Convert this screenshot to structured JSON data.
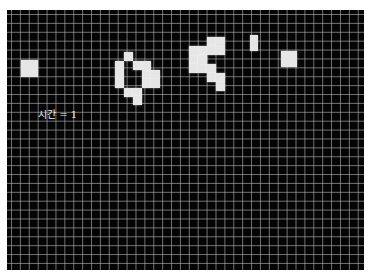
{
  "grid": {
    "cell_size_px": 8.9,
    "background": "#050505",
    "line_color": "#c8c8c8",
    "alive_color": "#e6e6e6"
  },
  "time_label": "시간 = 1",
  "cells": [
    [
      14,
      50,
      17,
      17
    ],
    [
      117,
      42,
      9,
      9
    ],
    [
      108,
      51,
      9,
      9
    ],
    [
      126,
      51,
      9,
      9
    ],
    [
      108,
      60,
      9,
      9
    ],
    [
      108,
      69,
      9,
      9
    ],
    [
      135,
      60,
      9,
      9
    ],
    [
      144,
      60,
      9,
      9
    ],
    [
      135,
      69,
      9,
      9
    ],
    [
      144,
      69,
      9,
      9
    ],
    [
      135,
      51,
      9,
      9
    ],
    [
      117,
      78,
      9,
      9
    ],
    [
      126,
      78,
      9,
      9
    ],
    [
      126,
      86,
      9,
      9
    ],
    [
      126,
      69,
      0,
      0
    ],
    [
      117,
      60,
      0,
      0
    ],
    [
      200,
      27,
      9,
      9
    ],
    [
      191,
      36,
      9,
      9
    ],
    [
      182,
      45,
      9,
      9
    ],
    [
      191,
      45,
      9,
      9
    ],
    [
      200,
      36,
      9,
      9
    ],
    [
      182,
      36,
      9,
      9
    ],
    [
      209,
      36,
      9,
      9
    ],
    [
      209,
      27,
      9,
      9
    ],
    [
      182,
      54,
      9,
      9
    ],
    [
      191,
      54,
      9,
      9
    ],
    [
      200,
      54,
      9,
      9
    ],
    [
      200,
      63,
      9,
      9
    ],
    [
      209,
      63,
      9,
      9
    ],
    [
      209,
      72,
      9,
      9
    ],
    [
      191,
      45,
      9,
      9
    ],
    [
      243,
      25,
      8,
      16
    ],
    [
      274,
      41,
      16,
      16
    ]
  ]
}
